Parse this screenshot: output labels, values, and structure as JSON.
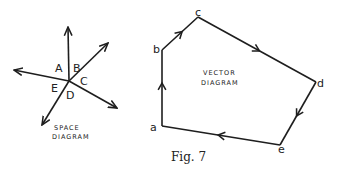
{
  "figure": {
    "caption": "Fig. 7",
    "colors": {
      "ink": "#1e1e1e",
      "background": "#ffffff"
    }
  },
  "space_diagram": {
    "title_line1": "SPACE",
    "title_line2": "DIAGRAM",
    "center": [
      69,
      81
    ],
    "forces": [
      {
        "name": "up",
        "to": [
          68,
          27
        ]
      },
      {
        "name": "upper-right",
        "to": [
          108,
          43
        ]
      },
      {
        "name": "lower-right",
        "to": [
          117,
          108
        ]
      },
      {
        "name": "lower-left",
        "to": [
          42,
          125
        ]
      },
      {
        "name": "left",
        "to": [
          14,
          70
        ]
      }
    ],
    "labels": [
      {
        "text": "A",
        "x": 55,
        "y": 72
      },
      {
        "text": "B",
        "x": 73,
        "y": 72
      },
      {
        "text": "C",
        "x": 80,
        "y": 84
      },
      {
        "text": "E",
        "x": 52,
        "y": 92
      },
      {
        "text": "D",
        "x": 66,
        "y": 99
      }
    ]
  },
  "vector_diagram": {
    "title_line1": "VECTOR",
    "title_line2": "DIAGRAM",
    "vertices": [
      {
        "label": "a",
        "x": 162,
        "y": 126,
        "lx": 151,
        "ly": 131
      },
      {
        "label": "b",
        "x": 162,
        "y": 50,
        "lx": 153,
        "ly": 52
      },
      {
        "label": "c",
        "x": 198,
        "y": 17,
        "lx": 195,
        "ly": 15
      },
      {
        "label": "d",
        "x": 316,
        "y": 82,
        "lx": 317,
        "ly": 87
      },
      {
        "label": "e",
        "x": 280,
        "y": 145,
        "lx": 278,
        "ly": 153
      }
    ],
    "edges": [
      "a-b",
      "b-c",
      "c-d",
      "d-e",
      "e-a"
    ]
  },
  "text": {
    "A": "A",
    "B": "B",
    "C": "C",
    "D": "D",
    "E": "E",
    "a": "a",
    "b": "b",
    "c": "c",
    "d": "d",
    "e": "e"
  }
}
